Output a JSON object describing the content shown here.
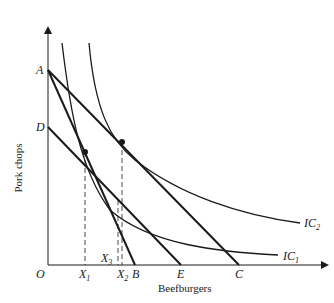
{
  "diagram": {
    "type": "indifference-curve-budget-lines",
    "axes": {
      "x_title": "Beefburgers",
      "y_title": "Pork chops",
      "origin_label": "O"
    },
    "y_axis_points": [
      {
        "id": "A",
        "label": "A"
      },
      {
        "id": "D",
        "label": "D"
      }
    ],
    "x_axis_points": [
      {
        "id": "X1",
        "label": "X",
        "sub": "1"
      },
      {
        "id": "X3",
        "label": "X",
        "sub": "3"
      },
      {
        "id": "X2",
        "label": "X",
        "sub": "2"
      },
      {
        "id": "B",
        "label": "B"
      },
      {
        "id": "E",
        "label": "E"
      },
      {
        "id": "C",
        "label": "C"
      }
    ],
    "budget_lines": [
      {
        "name": "AB",
        "from": "A",
        "to": "B"
      },
      {
        "name": "AC",
        "from": "A",
        "to": "C"
      },
      {
        "name": "DE",
        "from": "D",
        "to": "E"
      }
    ],
    "indifference_curves": [
      {
        "name": "IC1",
        "label": "IC",
        "sub": "1"
      },
      {
        "name": "IC2",
        "label": "IC",
        "sub": "2"
      }
    ],
    "tangency_points": [
      {
        "line": "AB",
        "curve": "IC1",
        "x_point": "X1"
      },
      {
        "line": "AC",
        "curve": "IC2",
        "x_point": "X2"
      },
      {
        "line": "DE",
        "curve": "IC1",
        "x_point": "X3"
      }
    ],
    "line_color": "#1a1a1a"
  }
}
